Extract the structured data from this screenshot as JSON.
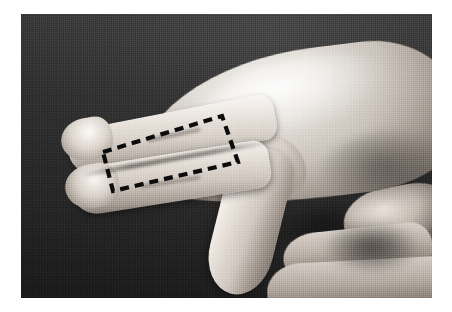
{
  "figure": {
    "kind": "grayscale-photograph",
    "caption": "",
    "label": ""
  },
  "canvas": {
    "width": 452,
    "height": 312,
    "page_background": "#ffffff"
  },
  "photo": {
    "x": 21,
    "y": 14,
    "width": 411,
    "height": 284,
    "background_color": "#333333",
    "tone": "grayscale",
    "print_style": "halftone"
  },
  "annotation": {
    "type": "dashed-rectangle",
    "stroke_color": "#0c0c0c",
    "stroke_width": 4.2,
    "dash_pattern": "9 6",
    "rotation_deg": -17,
    "corners": {
      "top_left": [
        103,
        152
      ],
      "top_right": [
        222,
        116
      ],
      "bottom_right": [
        238,
        162
      ],
      "bottom_left": [
        113,
        191
      ]
    },
    "points": "103,152 222,116 238,162 113,191",
    "region_described": "proximal phalanges of index and middle fingers"
  },
  "elements": {
    "dorsum": "back-of-hand",
    "finger_upper": "index-finger",
    "finger_lower": "middle-finger",
    "thumb": "thumb",
    "far_hand": "second-hand-fingers"
  }
}
